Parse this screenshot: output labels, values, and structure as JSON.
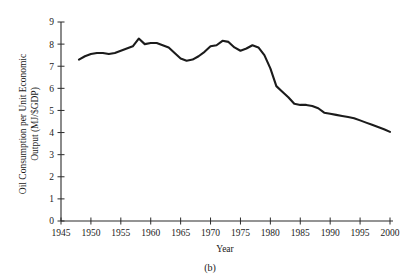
{
  "figure": {
    "caption": "(b)",
    "panel_letter": "b"
  },
  "chart_data": {
    "type": "line",
    "title": "",
    "subtitle": "",
    "xlabel": "Year",
    "ylabel": "Oil Consumption per Unit Economic Output (MJ/$GDP)",
    "ylabel_line1": "Oil Consumption per Unit Economic",
    "ylabel_line2": "Output (MJ/$GDP)",
    "xlim": [
      1945,
      2000
    ],
    "ylim": [
      0,
      9
    ],
    "xticks": [
      1945,
      1950,
      1955,
      1960,
      1965,
      1970,
      1975,
      1980,
      1985,
      1990,
      1995,
      2000
    ],
    "yticks": [
      0,
      1,
      2,
      3,
      4,
      5,
      6,
      7,
      8,
      9
    ],
    "xtick_labels": [
      "1945",
      "1950",
      "1955",
      "1960",
      "1965",
      "1970",
      "1975",
      "1980",
      "1985",
      "1990",
      "1995",
      "2000"
    ],
    "ytick_labels": [
      "0",
      "1",
      "2",
      "3",
      "4",
      "5",
      "6",
      "7",
      "8",
      "9"
    ],
    "grid": false,
    "legend": false,
    "legend_position": "none",
    "series": [
      {
        "name": "Oil consumption per unit economic output",
        "color": "#1b1b1b",
        "x": [
          1948,
          1949,
          1950,
          1951,
          1952,
          1953,
          1954,
          1955,
          1956,
          1957,
          1958,
          1959,
          1960,
          1961,
          1962,
          1963,
          1964,
          1965,
          1966,
          1967,
          1968,
          1969,
          1970,
          1971,
          1972,
          1973,
          1974,
          1975,
          1976,
          1977,
          1978,
          1979,
          1980,
          1981,
          1982,
          1983,
          1984,
          1985,
          1986,
          1987,
          1988,
          1989,
          1990,
          1991,
          1992,
          1993,
          1994,
          1995,
          1996,
          1997,
          1998,
          1999,
          2000
        ],
        "values": [
          7.3,
          7.45,
          7.55,
          7.6,
          7.6,
          7.55,
          7.6,
          7.7,
          7.8,
          7.9,
          8.25,
          8.0,
          8.05,
          8.05,
          7.95,
          7.85,
          7.6,
          7.35,
          7.25,
          7.3,
          7.45,
          7.65,
          7.9,
          7.95,
          8.15,
          8.1,
          7.85,
          7.7,
          7.8,
          7.95,
          7.85,
          7.5,
          6.9,
          6.1,
          5.85,
          5.6,
          5.3,
          5.25,
          5.25,
          5.2,
          5.1,
          4.9,
          4.85,
          4.8,
          4.75,
          4.7,
          4.65,
          4.55,
          4.45,
          4.35,
          4.25,
          4.15,
          4.03
        ]
      }
    ]
  }
}
